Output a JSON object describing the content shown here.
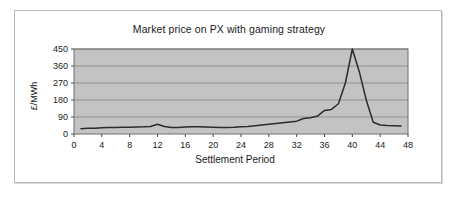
{
  "chart_data": {
    "type": "line",
    "title": "Market price on PX with gaming strategy",
    "xlabel": "Settlement Period",
    "ylabel": "£/MWh",
    "xlim": [
      0,
      48
    ],
    "ylim": [
      0,
      450
    ],
    "grid": true,
    "legend": "none",
    "xticks": [
      0,
      4,
      8,
      12,
      16,
      20,
      24,
      28,
      32,
      36,
      40,
      44,
      48
    ],
    "xtick_labels": [
      "0",
      "4",
      "8",
      "12",
      "16",
      "20",
      "24",
      "28",
      "32",
      "36",
      "40",
      "44",
      "48"
    ],
    "yticks": [
      0,
      90,
      180,
      270,
      360,
      450
    ],
    "ytick_labels": [
      "0",
      "90",
      "180",
      "270",
      "360",
      "450"
    ],
    "series": [
      {
        "name": "Market price",
        "color": "#2b2b2b",
        "x": [
          1,
          2,
          3,
          4,
          5,
          6,
          7,
          8,
          9,
          10,
          11,
          12,
          13,
          14,
          15,
          16,
          17,
          18,
          19,
          20,
          21,
          22,
          23,
          24,
          25,
          26,
          27,
          28,
          29,
          30,
          31,
          32,
          33,
          34,
          35,
          36,
          37,
          38,
          39,
          40,
          41,
          42,
          43,
          44,
          45,
          46,
          47
        ],
        "values": [
          28,
          30,
          31,
          33,
          34,
          35,
          36,
          36,
          37,
          38,
          40,
          52,
          40,
          35,
          35,
          37,
          38,
          38,
          37,
          36,
          35,
          35,
          36,
          38,
          40,
          44,
          48,
          52,
          56,
          60,
          64,
          68,
          82,
          86,
          95,
          125,
          130,
          160,
          270,
          450,
          330,
          180,
          62,
          48,
          45,
          44,
          42
        ]
      }
    ]
  },
  "axes": {
    "y_title": "£/MWh",
    "x_title": "Settlement Period"
  }
}
